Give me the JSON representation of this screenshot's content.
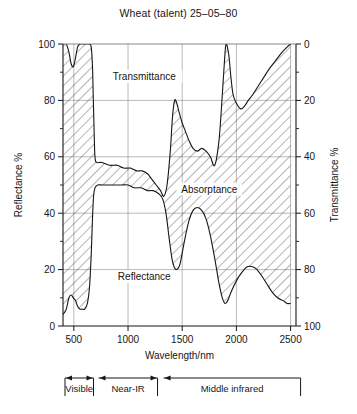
{
  "chart_data": {
    "type": "area",
    "title": "Wheat (talent) 25–05–80",
    "xlabel": "Wavelength/nm",
    "ylabel": "Reflectance %",
    "ylabel_right": "Transmittance %",
    "xlim": [
      400,
      2550
    ],
    "ylim": [
      0,
      100
    ],
    "ylim_right": [
      100,
      0
    ],
    "xticks": [
      500,
      1000,
      1500,
      2000,
      2500
    ],
    "yticks_left": [
      0,
      20,
      40,
      60,
      80,
      100
    ],
    "yticks_right": [
      0,
      20,
      40,
      60,
      80,
      100
    ],
    "grid": true,
    "legend_position": "inside-annotations",
    "annotations": [
      {
        "text": "Transmittance",
        "x": 1150,
        "y": 88
      },
      {
        "text": "Absorptance",
        "x": 1750,
        "y": 48
      },
      {
        "text": "Reflectance",
        "x": 1150,
        "y": 17
      }
    ],
    "series": [
      {
        "name": "Transmittance boundary (upper curve)",
        "note": "Upper edge of the absorptance band; value = 100 - transmittance",
        "points": [
          [
            400,
            100
          ],
          [
            430,
            100
          ],
          [
            455,
            97
          ],
          [
            475,
            93
          ],
          [
            495,
            92
          ],
          [
            515,
            95
          ],
          [
            535,
            99
          ],
          [
            560,
            100
          ],
          [
            600,
            100
          ],
          [
            640,
            100
          ],
          [
            660,
            99
          ],
          [
            672,
            92
          ],
          [
            680,
            80
          ],
          [
            688,
            68
          ],
          [
            695,
            60
          ],
          [
            710,
            58
          ],
          [
            760,
            58
          ],
          [
            830,
            57
          ],
          [
            900,
            57
          ],
          [
            960,
            56
          ],
          [
            1020,
            56
          ],
          [
            1080,
            55
          ],
          [
            1130,
            55
          ],
          [
            1180,
            54
          ],
          [
            1220,
            52
          ],
          [
            1260,
            50
          ],
          [
            1300,
            48
          ],
          [
            1330,
            46
          ],
          [
            1360,
            50
          ],
          [
            1390,
            62
          ],
          [
            1410,
            74
          ],
          [
            1430,
            80
          ],
          [
            1450,
            79
          ],
          [
            1470,
            76
          ],
          [
            1500,
            72
          ],
          [
            1530,
            69
          ],
          [
            1560,
            66
          ],
          [
            1600,
            63
          ],
          [
            1640,
            62
          ],
          [
            1680,
            63
          ],
          [
            1720,
            62
          ],
          [
            1760,
            60
          ],
          [
            1800,
            57
          ],
          [
            1840,
            66
          ],
          [
            1870,
            82
          ],
          [
            1890,
            94
          ],
          [
            1905,
            100
          ],
          [
            1930,
            96
          ],
          [
            1950,
            88
          ],
          [
            1970,
            82
          ],
          [
            2000,
            79
          ],
          [
            2040,
            77
          ],
          [
            2075,
            78
          ],
          [
            2110,
            80
          ],
          [
            2150,
            82
          ],
          [
            2200,
            85
          ],
          [
            2250,
            88
          ],
          [
            2300,
            91
          ],
          [
            2360,
            94
          ],
          [
            2420,
            97
          ],
          [
            2470,
            99
          ],
          [
            2500,
            100
          ]
        ]
      },
      {
        "name": "Reflectance (lower curve)",
        "points": [
          [
            400,
            4
          ],
          [
            430,
            6
          ],
          [
            455,
            10
          ],
          [
            475,
            11
          ],
          [
            495,
            10
          ],
          [
            515,
            9
          ],
          [
            535,
            7
          ],
          [
            555,
            6
          ],
          [
            575,
            6
          ],
          [
            600,
            6
          ],
          [
            625,
            8
          ],
          [
            645,
            14
          ],
          [
            660,
            25
          ],
          [
            672,
            38
          ],
          [
            682,
            46
          ],
          [
            695,
            49
          ],
          [
            720,
            50
          ],
          [
            760,
            50
          ],
          [
            820,
            50
          ],
          [
            880,
            50
          ],
          [
            940,
            50
          ],
          [
            1000,
            50
          ],
          [
            1060,
            49
          ],
          [
            1120,
            49
          ],
          [
            1180,
            48
          ],
          [
            1230,
            48
          ],
          [
            1280,
            47
          ],
          [
            1320,
            45
          ],
          [
            1350,
            40
          ],
          [
            1380,
            31
          ],
          [
            1405,
            24
          ],
          [
            1425,
            21
          ],
          [
            1450,
            20
          ],
          [
            1480,
            22
          ],
          [
            1520,
            30
          ],
          [
            1560,
            37
          ],
          [
            1600,
            41
          ],
          [
            1640,
            42
          ],
          [
            1680,
            41
          ],
          [
            1720,
            38
          ],
          [
            1760,
            32
          ],
          [
            1800,
            24
          ],
          [
            1840,
            15
          ],
          [
            1870,
            10
          ],
          [
            1895,
            8
          ],
          [
            1920,
            9
          ],
          [
            1950,
            12
          ],
          [
            2000,
            16
          ],
          [
            2050,
            19
          ],
          [
            2100,
            21
          ],
          [
            2150,
            21
          ],
          [
            2190,
            20
          ],
          [
            2230,
            18
          ],
          [
            2280,
            15
          ],
          [
            2330,
            12
          ],
          [
            2380,
            10
          ],
          [
            2430,
            9
          ],
          [
            2470,
            8
          ],
          [
            2500,
            8
          ]
        ]
      }
    ],
    "bands": [
      {
        "label": "Visible",
        "start": 400,
        "end": 700
      },
      {
        "label": "Near-IR",
        "start": 700,
        "end": 1300
      },
      {
        "label": "Middle infrared",
        "start": 1300,
        "end": 2500
      }
    ]
  },
  "axes": {
    "left": {
      "title": "Reflectance %",
      "ticks": [
        "0",
        "20",
        "40",
        "60",
        "80",
        "100"
      ]
    },
    "right": {
      "title": "Transmittance %",
      "ticks": [
        "0",
        "20",
        "40",
        "60",
        "80",
        "100"
      ]
    },
    "bottom": {
      "title": "Wavelength/nm",
      "ticks": [
        "500",
        "1000",
        "1500",
        "2000",
        "2500"
      ]
    }
  },
  "labels": {
    "transmittance": "Transmittance",
    "absorptance": "Absorptance",
    "reflectance": "Reflectance",
    "visible": "Visible",
    "near_ir": "Near-IR",
    "middle_infrared": "Middle infrared"
  },
  "colors": {
    "ink": "#161616",
    "grid": "#8a8a8a",
    "hatch": "#2b2b2b",
    "background": "#ffffff"
  }
}
